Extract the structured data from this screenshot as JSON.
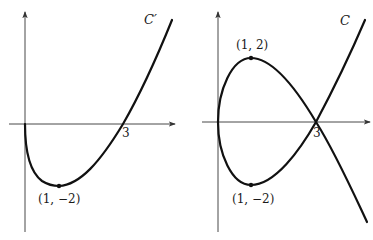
{
  "panels": [
    {
      "id": "left",
      "curve_label": "C′",
      "x_intercept_label": "3",
      "point_label": "(1, −2)",
      "description": "Graph of C′: starts at origin, dips to minimum at (1,−2), crosses x-axis at 3, rises"
    },
    {
      "id": "right",
      "curve_label": "C",
      "x_intercept_label": "3",
      "top_point_label": "(1, 2)",
      "bottom_point_label": "(1, −2)",
      "description": "Graph of C: nodal loop through origin with max (1,2), min (1,−2), self-intersecting at x=3"
    }
  ],
  "colors": {
    "curve": "#111111",
    "axis": "#333333",
    "background": "#ffffff"
  }
}
